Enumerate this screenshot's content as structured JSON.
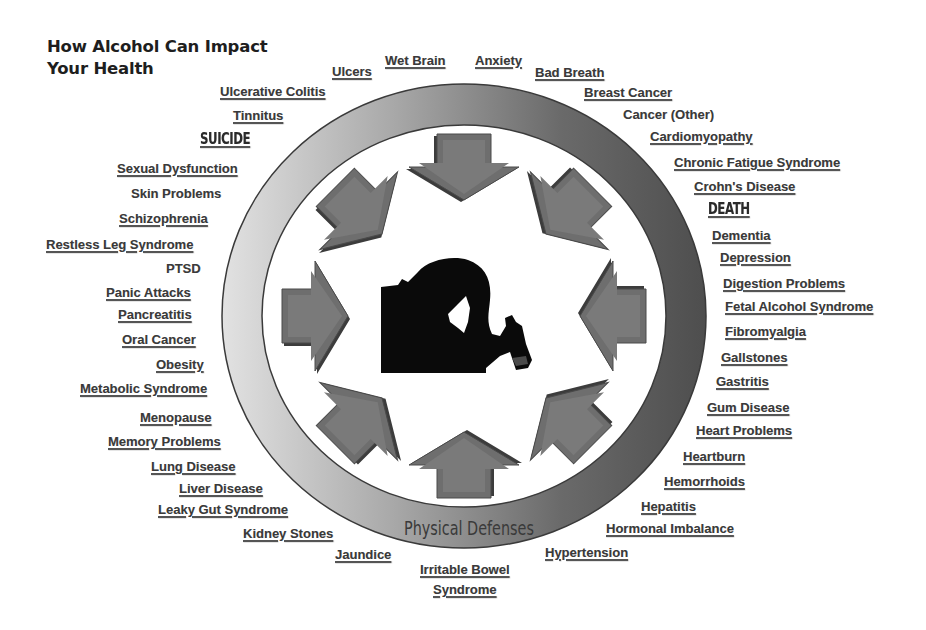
{
  "title": {
    "line1": "How Alcohol Can Impact",
    "line2": "Your Health"
  },
  "ring": {
    "label": "Physical Defenses",
    "center": [
      464,
      316
    ],
    "outer_radius": [
      242,
      232
    ],
    "inner_radius": [
      202,
      191
    ],
    "gradient_light": "#dcdcdc",
    "gradient_dark": "#555555",
    "stroke": "#3a3a3a"
  },
  "arrows": {
    "count": 8,
    "fill": "#6e6e6e",
    "shadow": "#3c3c3c",
    "direction": "inward"
  },
  "center_image": {
    "description": "silhouette of person holding head and a bottle"
  },
  "colors": {
    "text": "#3a3a3a",
    "title": "#1e1e1e",
    "background": "#ffffff"
  },
  "labels": [
    {
      "text": "Ulcers",
      "x": 332,
      "y": 64,
      "underline": true
    },
    {
      "text": "Wet Brain",
      "x": 385,
      "y": 53,
      "underline": true
    },
    {
      "text": "Anxiety",
      "x": 475,
      "y": 53,
      "underline": true
    },
    {
      "text": "Bad Breath",
      "x": 535,
      "y": 65,
      "underline": true
    },
    {
      "text": "Breast Cancer",
      "x": 584,
      "y": 85,
      "underline": true
    },
    {
      "text": "Cancer (Other)",
      "x": 623,
      "y": 107,
      "underline": false
    },
    {
      "text": "Cardiomyopathy",
      "x": 650,
      "y": 129,
      "underline": true
    },
    {
      "text": "Chronic Fatigue Syndrome",
      "x": 674,
      "y": 155,
      "underline": true
    },
    {
      "text": "Crohn's Disease",
      "x": 694,
      "y": 179,
      "underline": true
    },
    {
      "text": "DEATH",
      "x": 708,
      "y": 202,
      "underline": true,
      "style": "impact"
    },
    {
      "text": "Dementia",
      "x": 712,
      "y": 228,
      "underline": true
    },
    {
      "text": "Depression",
      "x": 720,
      "y": 250,
      "underline": true
    },
    {
      "text": "Digestion Problems",
      "x": 723,
      "y": 276,
      "underline": true
    },
    {
      "text": "Fetal Alcohol Syndrome",
      "x": 725,
      "y": 299,
      "underline": true
    },
    {
      "text": "Fibromyalgia",
      "x": 725,
      "y": 324,
      "underline": true
    },
    {
      "text": "Gallstones",
      "x": 721,
      "y": 350,
      "underline": true
    },
    {
      "text": "Gastritis",
      "x": 716,
      "y": 374,
      "underline": true
    },
    {
      "text": "Gum Disease",
      "x": 707,
      "y": 400,
      "underline": true
    },
    {
      "text": "Heart Problems",
      "x": 696,
      "y": 423,
      "underline": true
    },
    {
      "text": "Heartburn",
      "x": 683,
      "y": 449,
      "underline": true
    },
    {
      "text": "Hemorrhoids",
      "x": 664,
      "y": 474,
      "underline": true
    },
    {
      "text": "Hepatitis",
      "x": 641,
      "y": 499,
      "underline": true
    },
    {
      "text": "Hormonal  Imbalance",
      "x": 606,
      "y": 521,
      "underline": true
    },
    {
      "text": "Hypertension",
      "x": 545,
      "y": 545,
      "underline": true
    },
    {
      "text": "Irritable Bowel",
      "text2": "Syndrome",
      "x": 420,
      "y": 560,
      "underline": true,
      "style": "two"
    },
    {
      "text": "Jaundice",
      "x": 335,
      "y": 547,
      "underline": true
    },
    {
      "text": "Kidney Stones",
      "x": 243,
      "y": 526,
      "underline": true
    },
    {
      "text": "Leaky Gut Syndrome",
      "x": 158,
      "y": 502,
      "underline": true
    },
    {
      "text": "Liver Disease",
      "x": 179,
      "y": 481,
      "underline": true
    },
    {
      "text": "Lung Disease",
      "x": 151,
      "y": 459,
      "underline": true
    },
    {
      "text": "Memory Problems",
      "x": 108,
      "y": 434,
      "underline": true
    },
    {
      "text": "Menopause",
      "x": 140,
      "y": 410,
      "underline": true
    },
    {
      "text": "Metabolic Syndrome",
      "x": 80,
      "y": 381,
      "underline": true
    },
    {
      "text": "Obesity",
      "x": 156,
      "y": 357,
      "underline": true
    },
    {
      "text": "Oral Cancer",
      "x": 122,
      "y": 332,
      "underline": true
    },
    {
      "text": "Pancreatitis",
      "x": 118,
      "y": 307,
      "underline": true
    },
    {
      "text": "Panic Attacks",
      "x": 106,
      "y": 285,
      "underline": true
    },
    {
      "text": "PTSD",
      "x": 166,
      "y": 261,
      "underline": false
    },
    {
      "text": "Restless Leg Syndrome",
      "x": 46,
      "y": 237,
      "underline": true
    },
    {
      "text": "Schizophrenia",
      "x": 119,
      "y": 211,
      "underline": true
    },
    {
      "text": "Skin Problems",
      "x": 131,
      "y": 186,
      "underline": false
    },
    {
      "text": "Sexual Dysfunction",
      "x": 117,
      "y": 161,
      "underline": true
    },
    {
      "text": "SUICIDE",
      "x": 200,
      "y": 132,
      "underline": true,
      "style": "impact"
    },
    {
      "text": "Tinnitus",
      "x": 233,
      "y": 108,
      "underline": true
    },
    {
      "text": "Ulcerative Colitis",
      "x": 220,
      "y": 84,
      "underline": true
    }
  ]
}
